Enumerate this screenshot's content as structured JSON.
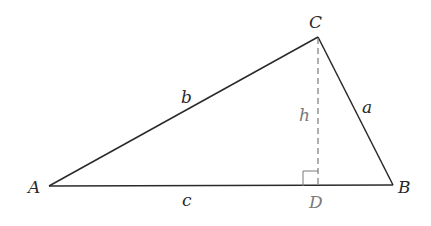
{
  "diagram": {
    "type": "triangle-with-altitude",
    "vertices": {
      "A": {
        "label": "A",
        "x": 49,
        "y": 186
      },
      "B": {
        "label": "B",
        "x": 393,
        "y": 185
      },
      "C": {
        "label": "C",
        "x": 318,
        "y": 37
      },
      "D": {
        "label": "D",
        "x": 318,
        "y": 186
      }
    },
    "sides": {
      "a": {
        "label": "a",
        "from": "C",
        "to": "B"
      },
      "b": {
        "label": "b",
        "from": "A",
        "to": "C"
      },
      "c": {
        "label": "c",
        "from": "A",
        "to": "B"
      }
    },
    "altitude": {
      "label": "h",
      "from": "C",
      "to": "D",
      "style": "dashed"
    },
    "right_angle_at": "D",
    "colors": {
      "edge": "#2a2a2a",
      "altitude": "#7a7a7a"
    }
  }
}
